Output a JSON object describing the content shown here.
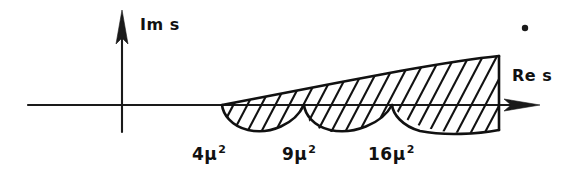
{
  "figure": {
    "background_color": "#ffffff",
    "ink_color": "#111111",
    "width": 583,
    "height": 178
  },
  "axes": {
    "vertical": {
      "label": "Im s",
      "name": "imaginary-axis",
      "arrow_direction": "up"
    },
    "horizontal": {
      "label": "Re s",
      "name": "real-axis",
      "arrow_direction": "right"
    },
    "origin": {
      "x": 122,
      "y": 105
    }
  },
  "branch_points": [
    {
      "id": "threshold-1",
      "label_number": "4",
      "label_symbol": "μ",
      "label_exponent": "2",
      "label_text": "4μ²",
      "x": 222
    },
    {
      "id": "threshold-2",
      "label_number": "9",
      "label_symbol": "μ",
      "label_exponent": "2",
      "label_text": "9μ²",
      "x": 304
    },
    {
      "id": "threshold-3",
      "label_number": "16",
      "label_symbol": "μ",
      "label_exponent": "2",
      "label_text": "16μ²",
      "x": 392
    }
  ],
  "hatched_region": {
    "name": "analyticity-cut-region",
    "description": "Hatched wedge opening to the right from the first threshold, bounded above by a rising curve and below by three scalloped arcs",
    "start_x": 222,
    "end_x": 499,
    "top_right_y": 57,
    "arc_depth_px": 26,
    "hatch_angle_deg": 62,
    "hatch_spacing_px": 14
  },
  "marks": [
    {
      "name": "ink-speck",
      "x": 525,
      "y": 28,
      "radius": 3
    }
  ]
}
